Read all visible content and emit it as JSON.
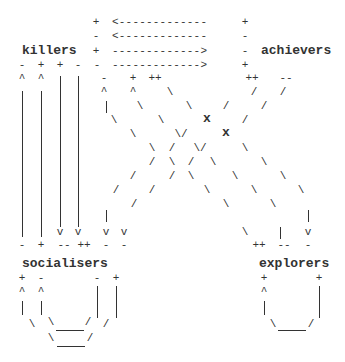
{
  "labels": {
    "killers": "killers",
    "achievers": "achievers",
    "socialisers": "socialisers",
    "explorers": "explorers"
  },
  "arrows": {
    "row0": "<-------------",
    "row1": "<-------------",
    "row2": "------------->",
    "row3": "------------->"
  },
  "signs": {
    "plus": "+",
    "minus": "-",
    "plusplus": "++",
    "minusminus": "--",
    "caret": "^",
    "vee": "v",
    "cross": "x",
    "back": "\\",
    "fwd": "/"
  }
}
